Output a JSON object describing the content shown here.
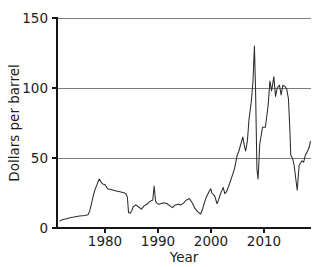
{
  "chart_data": {
    "type": "line",
    "title": "",
    "subtitle": "",
    "xlabel": "Year",
    "ylabel": "Dollars per barrel",
    "xlim": [
      1973.5,
      2018.6
    ],
    "ylim": [
      0,
      150
    ],
    "xticks": [
      1980,
      1990,
      2000,
      2010
    ],
    "xtick_labels": [
      "1980",
      "1990",
      "2000",
      "2010"
    ],
    "yticks": [
      0,
      50,
      100,
      150
    ],
    "ytick_labels": [
      "0",
      "50",
      "100",
      "150"
    ],
    "grid": "horizontal",
    "legend": "none",
    "series": [
      {
        "name": "Crude oil price",
        "color": "#2b2b2b",
        "x": [
          1974.0,
          1974.5,
          1975.0,
          1975.5,
          1976.0,
          1976.5,
          1977.0,
          1977.5,
          1978.0,
          1978.5,
          1979.0,
          1979.3,
          1979.6,
          1980.0,
          1980.3,
          1980.6,
          1981.0,
          1981.3,
          1981.6,
          1982.0,
          1982.5,
          1983.0,
          1983.5,
          1984.0,
          1984.5,
          1985.0,
          1985.5,
          1985.8,
          1986.0,
          1986.2,
          1986.5,
          1986.8,
          1987.0,
          1987.5,
          1988.0,
          1988.5,
          1989.0,
          1989.5,
          1990.0,
          1990.5,
          1990.75,
          1991.0,
          1991.3,
          1991.6,
          1992.0,
          1992.5,
          1993.0,
          1993.5,
          1994.0,
          1994.5,
          1995.0,
          1995.5,
          1996.0,
          1996.5,
          1997.0,
          1997.5,
          1998.0,
          1998.5,
          1999.0,
          1999.3,
          1999.6,
          2000.0,
          2000.5,
          2000.8,
          2001.0,
          2001.5,
          2001.9,
          2002.0,
          2002.5,
          2003.0,
          2003.3,
          2003.6,
          2004.0,
          2004.5,
          2005.0,
          2005.5,
          2005.8,
          2006.0,
          2006.5,
          2006.8,
          2007.0,
          2007.3,
          2007.6,
          2008.0,
          2008.3,
          2008.55,
          2008.75,
          2009.0,
          2009.2,
          2009.5,
          2010.0,
          2010.5,
          2011.0,
          2011.3,
          2011.6,
          2012.0,
          2012.3,
          2012.6,
          2013.0,
          2013.3,
          2013.6,
          2014.0,
          2014.3,
          2014.6,
          2014.85,
          2015.0,
          2015.3,
          2015.6,
          2016.0,
          2016.15,
          2016.5,
          2017.0,
          2017.3,
          2017.6,
          2018.0,
          2018.3,
          2018.5
        ],
        "y": [
          5.0,
          6.0,
          6.5,
          7.0,
          7.5,
          7.8,
          8.2,
          8.5,
          8.8,
          9.0,
          9.5,
          12.0,
          17.0,
          24.0,
          28.0,
          31.0,
          35.0,
          33.0,
          31.5,
          31.0,
          28.0,
          27.5,
          27.0,
          26.5,
          26.0,
          25.5,
          25.0,
          24.0,
          22.0,
          11.0,
          10.5,
          12.5,
          15.0,
          16.5,
          15.0,
          13.5,
          16.0,
          17.0,
          19.0,
          20.0,
          30.0,
          19.0,
          17.5,
          17.0,
          17.5,
          18.0,
          17.5,
          16.0,
          14.5,
          16.5,
          17.0,
          16.5,
          18.0,
          20.0,
          21.0,
          18.0,
          14.0,
          11.5,
          10.0,
          13.0,
          17.0,
          22.0,
          26.0,
          28.0,
          25.0,
          23.0,
          17.5,
          18.0,
          24.0,
          29.0,
          24.5,
          26.0,
          30.0,
          36.0,
          42.0,
          52.0,
          55.0,
          58.0,
          65.0,
          58.0,
          55.0,
          62.0,
          78.0,
          90.0,
          105.0,
          130.0,
          100.0,
          42.0,
          35.0,
          60.0,
          72.0,
          72.0,
          88.0,
          105.0,
          98.0,
          108.0,
          94.0,
          100.0,
          102.0,
          95.0,
          102.0,
          101.0,
          99.0,
          92.0,
          70.0,
          52.0,
          50.0,
          45.0,
          32.0,
          27.0,
          45.0,
          48.0,
          47.0,
          52.0,
          55.0,
          58.0,
          62.0
        ]
      }
    ],
    "annotations": []
  },
  "axes": {
    "y_title": "Dollars per barrel",
    "x_title": "Year"
  }
}
